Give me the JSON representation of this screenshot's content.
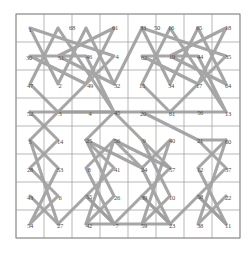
{
  "figure": {
    "background_color": "#ffffff",
    "grid_color": "#9a9a9a",
    "border_color": "#8a8a8a",
    "path_color": "#9e9e9e",
    "label_color": "#4a4a4a",
    "rows": 8,
    "cols": 8,
    "grid": {
      "x0": 16,
      "y0": 14,
      "x1": 240,
      "y1": 238
    }
  },
  "chart_data": {
    "type": "scatter",
    "title": "",
    "xlabel": "",
    "ylabel": "",
    "grid": true,
    "legend": "none",
    "xlim": [
      0,
      8
    ],
    "ylim": [
      0,
      8
    ],
    "node_rows": [
      [
        1,
        68,
        61,
        50,
        33,
        16,
        65,
        18
      ],
      [
        30,
        51,
        46,
        4,
        62,
        19,
        44,
        35
      ],
      [
        47,
        2,
        49,
        32,
        15,
        34,
        17,
        64
      ],
      [
        52,
        3,
        4,
        45,
        20,
        61,
        56,
        13
      ],
      [
        5,
        14,
        25,
        56,
        9,
        40,
        21,
        60
      ],
      [
        28,
        53,
        8,
        41,
        24,
        57,
        12,
        37
      ],
      [
        43,
        6,
        55,
        26,
        39,
        10,
        58,
        22
      ],
      [
        54,
        27,
        42,
        7,
        59,
        23,
        38,
        11
      ]
    ],
    "nodes": [
      {
        "label": "1",
        "x": 30,
        "y": 30
      },
      {
        "label": "68",
        "x": 72,
        "y": 28
      },
      {
        "label": "61",
        "x": 115,
        "y": 28
      },
      {
        "label": "50",
        "x": 157,
        "y": 28
      },
      {
        "label": "33",
        "x": 143,
        "y": 28
      },
      {
        "label": "16",
        "x": 171,
        "y": 28
      },
      {
        "label": "65",
        "x": 199,
        "y": 28
      },
      {
        "label": "18",
        "x": 228,
        "y": 28
      },
      {
        "label": "30",
        "x": 29,
        "y": 58
      },
      {
        "label": "51",
        "x": 61,
        "y": 58
      },
      {
        "label": "46",
        "x": 89,
        "y": 57
      },
      {
        "label": "4",
        "x": 117,
        "y": 57
      },
      {
        "label": "62",
        "x": 144,
        "y": 58
      },
      {
        "label": "19",
        "x": 172,
        "y": 57
      },
      {
        "label": "44",
        "x": 200,
        "y": 57
      },
      {
        "label": "35",
        "x": 228,
        "y": 57
      },
      {
        "label": "47",
        "x": 30,
        "y": 86
      },
      {
        "label": "2",
        "x": 60,
        "y": 86
      },
      {
        "label": "49",
        "x": 90,
        "y": 86
      },
      {
        "label": "32",
        "x": 117,
        "y": 86
      },
      {
        "label": "15",
        "x": 142,
        "y": 86
      },
      {
        "label": "34",
        "x": 171,
        "y": 86
      },
      {
        "label": "17",
        "x": 199,
        "y": 86
      },
      {
        "label": "64",
        "x": 228,
        "y": 86
      },
      {
        "label": "52",
        "x": 30,
        "y": 114
      },
      {
        "label": "3",
        "x": 60,
        "y": 114
      },
      {
        "label": "4",
        "x": 90,
        "y": 114
      },
      {
        "label": "45",
        "x": 117,
        "y": 113
      },
      {
        "label": "20",
        "x": 143,
        "y": 114
      },
      {
        "label": "61",
        "x": 172,
        "y": 114
      },
      {
        "label": "56",
        "x": 200,
        "y": 113
      },
      {
        "label": "13",
        "x": 228,
        "y": 114
      },
      {
        "label": "5",
        "x": 30,
        "y": 142
      },
      {
        "label": "14",
        "x": 60,
        "y": 142
      },
      {
        "label": "25",
        "x": 89,
        "y": 141
      },
      {
        "label": "56",
        "x": 117,
        "y": 141
      },
      {
        "label": "9",
        "x": 144,
        "y": 141
      },
      {
        "label": "40",
        "x": 172,
        "y": 141
      },
      {
        "label": "21",
        "x": 200,
        "y": 141
      },
      {
        "label": "60",
        "x": 228,
        "y": 142
      },
      {
        "label": "28",
        "x": 30,
        "y": 170
      },
      {
        "label": "53",
        "x": 60,
        "y": 170
      },
      {
        "label": "8",
        "x": 89,
        "y": 170
      },
      {
        "label": "41",
        "x": 117,
        "y": 170
      },
      {
        "label": "24",
        "x": 144,
        "y": 170
      },
      {
        "label": "57",
        "x": 172,
        "y": 170
      },
      {
        "label": "12",
        "x": 200,
        "y": 170
      },
      {
        "label": "37",
        "x": 228,
        "y": 170
      },
      {
        "label": "43",
        "x": 30,
        "y": 198
      },
      {
        "label": "6",
        "x": 60,
        "y": 198
      },
      {
        "label": "55",
        "x": 89,
        "y": 197
      },
      {
        "label": "26",
        "x": 117,
        "y": 198
      },
      {
        "label": "39",
        "x": 144,
        "y": 198
      },
      {
        "label": "10",
        "x": 172,
        "y": 198
      },
      {
        "label": "58",
        "x": 200,
        "y": 197
      },
      {
        "label": "22",
        "x": 228,
        "y": 198
      },
      {
        "label": "54",
        "x": 30,
        "y": 226
      },
      {
        "label": "27",
        "x": 60,
        "y": 226
      },
      {
        "label": "42",
        "x": 89,
        "y": 226
      },
      {
        "label": "7",
        "x": 117,
        "y": 226
      },
      {
        "label": "59",
        "x": 144,
        "y": 226
      },
      {
        "label": "23",
        "x": 172,
        "y": 226
      },
      {
        "label": "38",
        "x": 200,
        "y": 226
      },
      {
        "label": "11",
        "x": 228,
        "y": 226
      }
    ]
  }
}
